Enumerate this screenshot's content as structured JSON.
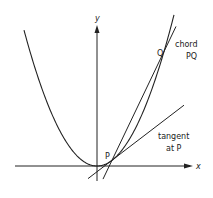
{
  "diagram": {
    "title": "",
    "axes": {
      "x_label": "x",
      "y_label": "y"
    },
    "curve": "parabola",
    "points": {
      "P": "P",
      "Q": "Q"
    },
    "labels": {
      "chord_line1": "chord",
      "chord_line2": "PQ",
      "tangent_line1": "tangent",
      "tangent_line2": "at P"
    },
    "colors": {
      "ink": "#222222",
      "background": "#ffffff"
    }
  }
}
